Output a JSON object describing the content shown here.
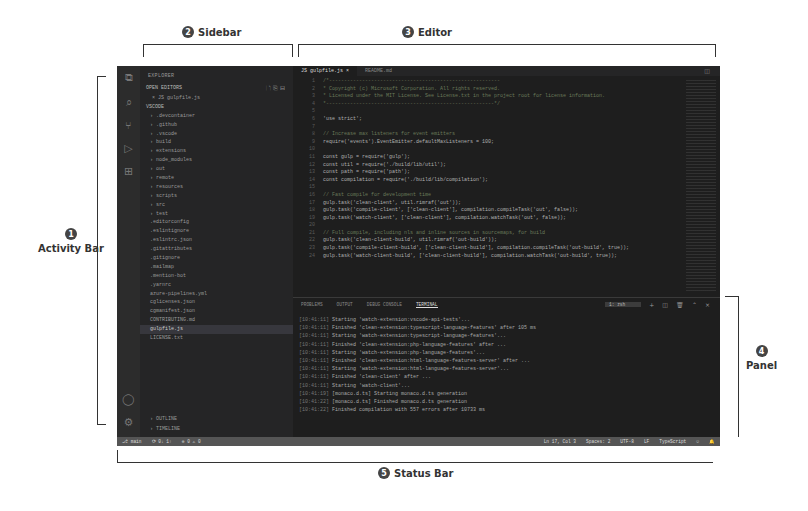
{
  "annotations": {
    "activity_bar": {
      "num": "1",
      "label": "Activity Bar"
    },
    "sidebar": {
      "num": "2",
      "label": "Sidebar"
    },
    "editor": {
      "num": "3",
      "label": "Editor"
    },
    "panel": {
      "num": "4",
      "label": "Panel"
    },
    "status_bar": {
      "num": "5",
      "label": "Status Bar"
    }
  },
  "activity_bar": {
    "icons": [
      "files-icon",
      "search-icon",
      "source-control-icon",
      "run-debug-icon",
      "extensions-icon"
    ],
    "bottom_icons": [
      "account-icon",
      "settings-gear-icon"
    ]
  },
  "sidebar": {
    "title": "EXPLORER",
    "open_editors": "OPEN EDITORS",
    "open_file": "× JS gulpfile.js",
    "folder": "VSCODE",
    "items": [
      "› .devcontainer",
      "› .github",
      "› .vscode",
      "› build",
      "› extensions",
      "› node_modules",
      "› out",
      "› remote",
      "› resources",
      "› scripts",
      "› src",
      "› test",
      "  .editorconfig",
      "  .eslintignore",
      "  .eslintrc.json",
      "  .gitattributes",
      "  .gitignore",
      "  .mailmap",
      "  .mention-bot",
      "  .yarnrc",
      "  azure-pipelines.yml",
      "  cglicenses.json",
      "  cgmanifest.json",
      "  CONTRIBUTING.md",
      "  gulpfile.js",
      "  LICENSE.txt"
    ],
    "selected_index": 24,
    "outline": "› OUTLINE",
    "timeline": "› TIMELINE"
  },
  "editor": {
    "tabs": [
      {
        "label": "JS gulpfile.js  ×",
        "active": true
      },
      {
        "label": "README.md",
        "active": false
      }
    ],
    "code_lines": [
      {
        "n": "1",
        "t": "/*---------------------------------------------------------",
        "c": true
      },
      {
        "n": "2",
        "t": " *  Copyright (c) Microsoft Corporation. All rights reserved.",
        "c": true
      },
      {
        "n": "3",
        "t": " *  Licensed under the MIT License. See License.txt in the project root for license information.",
        "c": true
      },
      {
        "n": "4",
        "t": " *--------------------------------------------------------*/",
        "c": true
      },
      {
        "n": "5",
        "t": "",
        "c": false
      },
      {
        "n": "6",
        "t": "'use strict';",
        "c": false
      },
      {
        "n": "7",
        "t": "",
        "c": false
      },
      {
        "n": "8",
        "t": "// Increase max listeners for event emitters",
        "c": true
      },
      {
        "n": "9",
        "t": "require('events').EventEmitter.defaultMaxListeners = 100;",
        "c": false
      },
      {
        "n": "10",
        "t": "",
        "c": false
      },
      {
        "n": "11",
        "t": "const gulp = require('gulp');",
        "c": false
      },
      {
        "n": "12",
        "t": "const util = require('./build/lib/util');",
        "c": false
      },
      {
        "n": "13",
        "t": "const path = require('path');",
        "c": false
      },
      {
        "n": "14",
        "t": "const compilation = require('./build/lib/compilation');",
        "c": false
      },
      {
        "n": "15",
        "t": "",
        "c": false
      },
      {
        "n": "16",
        "t": "// Fast compile for development time",
        "c": true
      },
      {
        "n": "17",
        "t": "gulp.task('clean-client', util.rimraf('out'));",
        "c": false
      },
      {
        "n": "18",
        "t": "gulp.task('compile-client', ['clean-client'], compilation.compileTask('out', false));",
        "c": false
      },
      {
        "n": "19",
        "t": "gulp.task('watch-client', ['clean-client'], compilation.watchTask('out', false));",
        "c": false
      },
      {
        "n": "20",
        "t": "",
        "c": false
      },
      {
        "n": "21",
        "t": "// Full compile, including nls and inline sources in sourcemaps, for build",
        "c": true
      },
      {
        "n": "22",
        "t": "gulp.task('clean-client-build', util.rimraf('out-build'));",
        "c": false
      },
      {
        "n": "23",
        "t": "gulp.task('compile-client-build', ['clean-client-build'], compilation.compileTask('out-build', true));",
        "c": false
      },
      {
        "n": "24",
        "t": "gulp.task('watch-client-build', ['clean-client-build'], compilation.watchTask('out-build', true));",
        "c": false
      }
    ]
  },
  "panel": {
    "tabs": [
      "PROBLEMS",
      "OUTPUT",
      "DEBUG CONSOLE",
      "TERMINAL"
    ],
    "active_tab": "TERMINAL",
    "terminal_select": "1: zsh",
    "controls": [
      "add-terminal-icon",
      "split-terminal-icon",
      "trash-icon",
      "maximize-icon",
      "close-icon"
    ],
    "terminal_lines": [
      {
        "ts": "[10:41:11]",
        "t": "Starting 'watch-extension:vscode-api-tests'..."
      },
      {
        "ts": "[10:41:11]",
        "t": "Finished 'clean-extension:typescript-language-features' after 105 ms"
      },
      {
        "ts": "[10:41:11]",
        "t": "Starting 'watch-extension:typescript-language-features'..."
      },
      {
        "ts": "[10:41:11]",
        "t": "Finished 'clean-extension:php-language-features' after ..."
      },
      {
        "ts": "[10:41:11]",
        "t": "Starting 'watch-extension:php-language-features'..."
      },
      {
        "ts": "[10:41:11]",
        "t": "Finished 'clean-extension:html-language-features-server' after ..."
      },
      {
        "ts": "[10:41:11]",
        "t": "Starting 'watch-extension:html-language-features-server'..."
      },
      {
        "ts": "[10:41:11]",
        "t": "Finished 'clean-client' after ..."
      },
      {
        "ts": "[10:41:11]",
        "t": "Starting 'watch-client'..."
      },
      {
        "ts": "[10:41:19]",
        "t": "[monaco.d.ts] Starting monaco.d.ts generation"
      },
      {
        "ts": "[10:41:22]",
        "t": "[monaco.d.ts] Finished monaco.d.ts generation"
      },
      {
        "ts": "[10:41:22]",
        "t": "Finished compilation with 557 errors after 10733 ms"
      }
    ]
  },
  "status_bar": {
    "left": [
      "⎇ main",
      "⟳ 0↓ 1↑",
      "⊗ 0 ⚠ 0"
    ],
    "right": [
      "Ln 17, Col 3",
      "Spaces: 2",
      "UTF-8",
      "LF",
      "TypeScript",
      "☺",
      "🔔"
    ]
  }
}
